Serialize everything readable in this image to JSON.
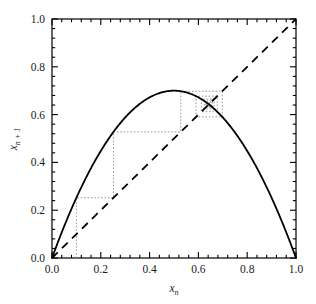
{
  "chart_data": {
    "type": "line",
    "title": "",
    "xlabel": "x_n",
    "ylabel": "x_{n+1}",
    "xlim": [
      0.0,
      1.0
    ],
    "ylim": [
      0.0,
      1.0
    ],
    "grid": false,
    "legend": "none",
    "xticks": [
      0.0,
      0.2,
      0.4,
      0.6,
      0.8,
      1.0
    ],
    "xticklabels": [
      "0.0",
      "0.2",
      "0.4",
      "0.6",
      "0.8",
      "1.0"
    ],
    "yticks": [
      0.0,
      0.2,
      0.4,
      0.6,
      0.8,
      1.0
    ],
    "yticklabels": [
      "0.0",
      "0.2",
      "0.4",
      "0.6",
      "0.8",
      "1.0"
    ],
    "minor_ticks_per_interval": 4,
    "series": [
      {
        "name": "logistic-map",
        "style": "solid",
        "color": "#000000",
        "equation": "x_{n+1} = r*x_n*(1-x_n)",
        "r": 2.8,
        "x": [
          0.0,
          0.05,
          0.1,
          0.15,
          0.2,
          0.25,
          0.3,
          0.35,
          0.4,
          0.45,
          0.5,
          0.55,
          0.6,
          0.65,
          0.7,
          0.75,
          0.8,
          0.85,
          0.9,
          0.95,
          1.0
        ],
        "y": [
          0.0,
          0.133,
          0.252,
          0.357,
          0.448,
          0.525,
          0.588,
          0.637,
          0.672,
          0.693,
          0.7,
          0.693,
          0.672,
          0.637,
          0.588,
          0.525,
          0.448,
          0.357,
          0.252,
          0.133,
          0.0
        ]
      },
      {
        "name": "identity-diagonal",
        "style": "dashed",
        "color": "#000000",
        "equation": "x_{n+1} = x_n",
        "x": [
          0.0,
          1.0
        ],
        "y": [
          0.0,
          1.0
        ]
      },
      {
        "name": "cobweb-trajectory",
        "style": "dotted",
        "color": "#808080",
        "x0": 0.1,
        "iterates": [
          0.1,
          0.252,
          0.528,
          0.698,
          0.59,
          0.677,
          0.612,
          0.665,
          0.624,
          0.656,
          0.632,
          0.651,
          0.637,
          0.647,
          0.64,
          0.645,
          0.641,
          0.644,
          0.642,
          0.643
        ],
        "fixed_point": 0.643
      }
    ],
    "annotations": []
  },
  "axes": {
    "x_label_text": "x",
    "x_label_sub": "n",
    "y_label_text": "x",
    "y_label_sub": "n + 1"
  }
}
